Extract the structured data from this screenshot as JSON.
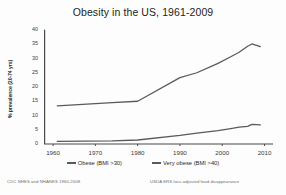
{
  "chart_data": {
    "type": "line",
    "title": "Obesity in the US, 1961-2009",
    "xlabel": "",
    "ylabel": "% prevalence (20-74 yrs)",
    "xlim": [
      1958,
      2012
    ],
    "ylim": [
      0,
      40
    ],
    "xticks": [
      1960,
      1970,
      1980,
      1990,
      2000,
      2010
    ],
    "yticks": [
      0,
      5,
      10,
      15,
      20,
      25,
      30,
      35,
      40
    ],
    "grid": false,
    "legend_position": "bottom",
    "series": [
      {
        "name": "Obese (BMI >30)",
        "color": "#5a5a5a",
        "x": [
          1961,
          1974,
          1980,
          1990,
          1994,
          1999,
          2002,
          2004,
          2006,
          2007,
          2009
        ],
        "values": [
          13.4,
          14.5,
          15.0,
          23.3,
          25.0,
          28.3,
          30.6,
          32.2,
          34.3,
          35.1,
          34.2
        ]
      },
      {
        "name": "Very obese (BMI >40)",
        "color": "#5a5a5a",
        "x": [
          1961,
          1974,
          1980,
          1990,
          1994,
          1999,
          2002,
          2004,
          2006,
          2007,
          2009
        ],
        "values": [
          0.9,
          1.1,
          1.4,
          3.0,
          3.8,
          4.7,
          5.4,
          5.9,
          6.2,
          6.9,
          6.7
        ]
      }
    ]
  },
  "legend": {
    "items": [
      {
        "label": "Obese (BMI >30)"
      },
      {
        "label": "Very obese (BMI >40)"
      }
    ]
  },
  "footer": {
    "left": "CDC NHES and NHANES 1960-2008",
    "right": "USDA ERS loss-adjusted food disappearance"
  },
  "axis": {
    "y_title": "% prevalence (20-74 yrs)",
    "y_tick_labels": [
      "40",
      "35",
      "30",
      "25",
      "20",
      "15",
      "10",
      "5",
      "0"
    ],
    "x_tick_labels": [
      "1960",
      "1970",
      "1980",
      "1990",
      "2000",
      "2010"
    ]
  }
}
